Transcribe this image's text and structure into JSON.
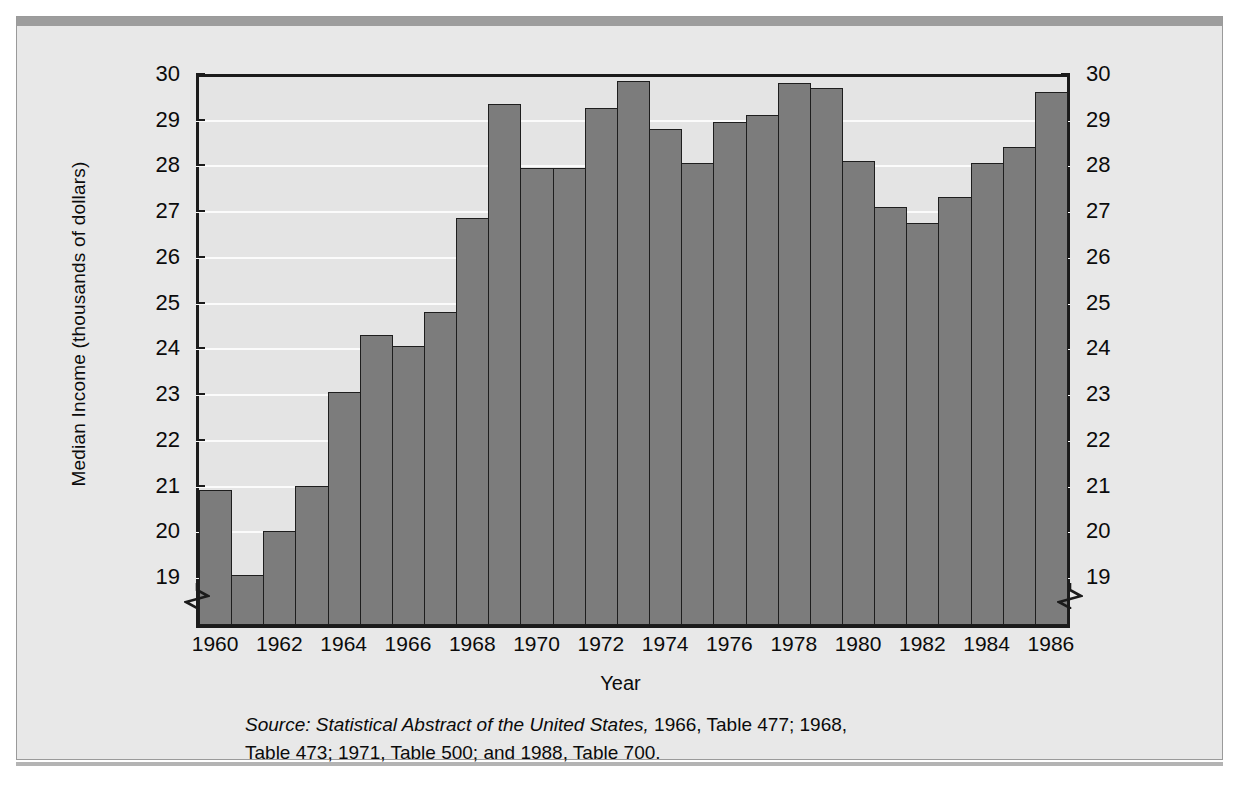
{
  "figure": {
    "source_line1_italic": "Source: Statistical Abstract of the United States,",
    "source_line1_rest": " 1966, Table 477; 1968,",
    "source_line2": "Table 473; 1971, Table 500; and 1988, Table 700.",
    "panel_bg": "#e8e8e8",
    "plot_bg": "#e4e4e4",
    "bar_fill": "#7c7c7c",
    "bar_stroke": "#1e1e1e",
    "gridline_color": "#fbfbfb",
    "axis_color": "#1b1b1b"
  },
  "chart_data": {
    "type": "bar",
    "title": "",
    "xlabel": "Year",
    "ylabel": "Median Income (thousands of dollars)",
    "ylim": [
      18.4,
      30
    ],
    "ytick_values": [
      19,
      20,
      21,
      22,
      23,
      24,
      25,
      26,
      27,
      28,
      29,
      30
    ],
    "ytick_labels": [
      "19",
      "20",
      "21",
      "22",
      "23",
      "24",
      "25",
      "26",
      "27",
      "28",
      "29",
      "30"
    ],
    "y_axis_broken": true,
    "grid": true,
    "legend": null,
    "dual_y_axis": true,
    "categories": [
      "1960",
      "1961",
      "1962",
      "1963",
      "1964",
      "1965",
      "1966",
      "1967",
      "1968",
      "1969",
      "1970",
      "1971",
      "1972",
      "1973",
      "1974",
      "1975",
      "1976",
      "1977",
      "1978",
      "1979",
      "1980",
      "1981",
      "1982",
      "1983",
      "1984",
      "1985",
      "1986"
    ],
    "xtick_labels": [
      "1960",
      "1962",
      "1964",
      "1966",
      "1968",
      "1970",
      "1972",
      "1974",
      "1976",
      "1978",
      "1980",
      "1982",
      "1984",
      "1986"
    ],
    "values": [
      20.9,
      19.05,
      20.0,
      21.0,
      23.05,
      24.3,
      24.05,
      24.8,
      26.85,
      29.35,
      27.95,
      27.95,
      29.25,
      29.85,
      28.8,
      28.05,
      28.95,
      29.1,
      29.8,
      29.7,
      28.1,
      27.1,
      26.75,
      27.3,
      28.05,
      28.4,
      29.6
    ]
  },
  "axis": {
    "break_symbol_left": "axis-break-left",
    "break_symbol_right": "axis-break-right"
  }
}
